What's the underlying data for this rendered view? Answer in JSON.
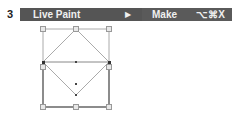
{
  "step": {
    "number": "3"
  },
  "menu": {
    "item_label": "Live Paint",
    "submenu_arrow": "▶",
    "submenu_item": "Make",
    "shortcut": "⌥⌘X"
  },
  "diagram": {
    "handle_color": "#999999",
    "stroke_color": "#888888"
  }
}
